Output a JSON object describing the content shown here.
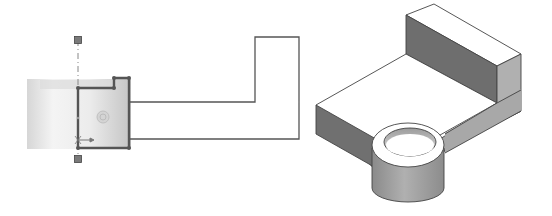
{
  "figure": {
    "panels": [
      {
        "id": "sketch-view",
        "description": "2D revolve sketch with centerline and cylinder preview",
        "elements": [
          "centerline",
          "cylinder-preview",
          "profile-sketch",
          "extrusion-outline",
          "origin-marker",
          "endpoint-handles"
        ]
      },
      {
        "id": "isometric-view",
        "description": "3D isometric view of L-bracket with cylindrical boss",
        "elements": [
          "base-plate",
          "upright-wall",
          "cylindrical-boss",
          "bore-hole"
        ]
      }
    ],
    "colors": {
      "background": "#ffffff",
      "sketch_line": "#555555",
      "outline": "#444444",
      "handle_fill": "#7a7a7a",
      "cylinder_light": "#f2f2f2",
      "cylinder_dark": "#c8c8c8",
      "face_top": "#ffffff",
      "face_dark": "#6e6e6e",
      "face_mid": "#9a9a9a",
      "face_light": "#b4b4b4"
    }
  }
}
